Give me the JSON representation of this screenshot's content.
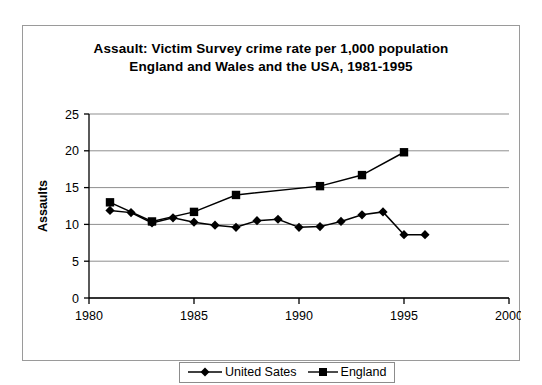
{
  "chart_data": {
    "type": "line",
    "title": "Assault: Victim Survey crime rate per 1,000 population England and Wales and the USA, 1981-1995",
    "title_line1": "Assault: Victim Survey crime rate per 1,000 population",
    "title_line2": "England and Wales and the USA, 1981-1995",
    "xlabel": "",
    "ylabel": "Assaults",
    "xlim": [
      1980,
      2000
    ],
    "ylim": [
      0,
      25
    ],
    "xticks": [
      "1980",
      "1985",
      "1990",
      "1995",
      "2000"
    ],
    "xtick_values": [
      1980,
      1985,
      1990,
      1995,
      2000
    ],
    "yticks": [
      "0",
      "5",
      "10",
      "15",
      "20",
      "25"
    ],
    "ytick_values": [
      0,
      5,
      10,
      15,
      20,
      25
    ],
    "grid": "horizontal",
    "legend_position": "bottom-center",
    "series": [
      {
        "name": "United Sates",
        "marker": "diamond",
        "color": "#000000",
        "x": [
          1981,
          1982,
          1983,
          1984,
          1985,
          1986,
          1987,
          1988,
          1989,
          1990,
          1991,
          1992,
          1993,
          1994,
          1995,
          1996
        ],
        "values": [
          11.9,
          11.6,
          10.2,
          10.9,
          10.3,
          9.9,
          9.6,
          10.5,
          10.7,
          9.6,
          9.7,
          10.4,
          11.3,
          11.7,
          8.6,
          8.6
        ]
      },
      {
        "name": "England",
        "marker": "square",
        "color": "#000000",
        "x": [
          1981,
          1983,
          1985,
          1987,
          1991,
          1993,
          1995
        ],
        "values": [
          13.0,
          10.4,
          11.7,
          14.0,
          15.2,
          16.7,
          19.8
        ]
      }
    ]
  },
  "legend": {
    "entries": [
      {
        "label": "United Sates"
      },
      {
        "label": "England"
      }
    ]
  },
  "colors": {
    "frame_border": "#9a9a9a",
    "axis": "#000000",
    "gridline": "#8f8f8f",
    "plot_background": "#ffffff",
    "page_background": "#ffffff"
  }
}
